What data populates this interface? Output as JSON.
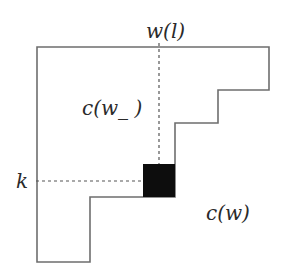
{
  "diagram": {
    "labels": {
      "top": "w(l)",
      "inner": "c(w_ )",
      "left": "k",
      "outer": "c(w)"
    },
    "colors": {
      "outline": "#6e6e6e",
      "dashed": "#555555",
      "cell": "#0d0d0d",
      "background": "#ffffff"
    }
  }
}
